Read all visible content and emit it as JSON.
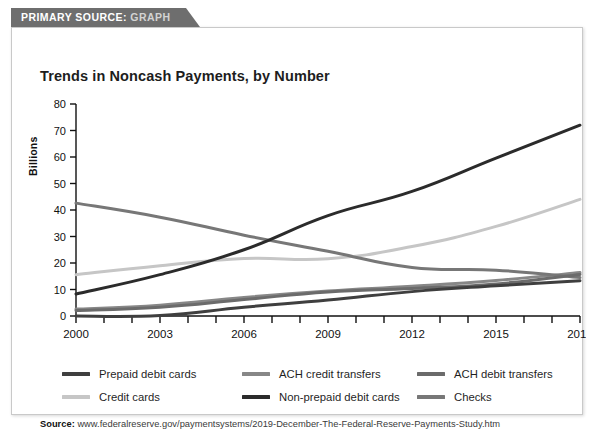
{
  "ribbon": {
    "prefix": "PRIMARY SOURCE:",
    "kind": "GRAPH"
  },
  "title": "Trends in Noncash Payments, by Number",
  "source": {
    "label": "Source:",
    "url": "www.federalreserve.gov/paymentsystems/2019-December-The-Federal-Reserve-Payments-Study.htm"
  },
  "legend": {
    "items": [
      {
        "label": "Prepaid debit cards",
        "color": "#3f3f3f"
      },
      {
        "label": "ACH credit transfers",
        "color": "#878787"
      },
      {
        "label": "ACH debit transfers",
        "color": "#6b6b6b"
      },
      {
        "label": "Credit cards",
        "color": "#c6c6c6"
      },
      {
        "label": "Non-prepaid debit cards",
        "color": "#2b2b2b"
      },
      {
        "label": "Checks",
        "color": "#777777"
      }
    ]
  },
  "chart_data": {
    "type": "line",
    "title": "Trends in Noncash Payments, by Number",
    "xlabel": "",
    "ylabel": "Billions",
    "xlim": [
      2000,
      2018
    ],
    "ylim": [
      0,
      80
    ],
    "ytick_step": 10,
    "yticks": [
      0,
      10,
      20,
      30,
      40,
      50,
      60,
      70,
      80
    ],
    "xticks": [
      2000,
      2001,
      2002,
      2003,
      2004,
      2005,
      2006,
      2007,
      2008,
      2009,
      2010,
      2011,
      2012,
      2013,
      2014,
      2015,
      2016,
      2017,
      2018
    ],
    "xtick_labels_shown": [
      2000,
      2003,
      2006,
      2009,
      2012,
      2015,
      2018
    ],
    "grid": false,
    "legend_position": "below",
    "x": [
      2000,
      2003,
      2006,
      2009,
      2012,
      2015,
      2018
    ],
    "series": [
      {
        "name": "Non-prepaid debit cards",
        "color": "#2b2b2b",
        "values": [
          8.3,
          15.6,
          25.0,
          37.9,
          47.0,
          59.6,
          72.0
        ]
      },
      {
        "name": "Credit cards",
        "color": "#c6c6c6",
        "values": [
          15.6,
          19.0,
          21.7,
          21.6,
          26.2,
          33.8,
          44.0
        ]
      },
      {
        "name": "Checks",
        "color": "#777777",
        "values": [
          42.6,
          37.3,
          30.5,
          24.4,
          18.3,
          17.3,
          14.5
        ]
      },
      {
        "name": "ACH credit transfers",
        "color": "#878787",
        "values": [
          2.6,
          4.1,
          7.0,
          9.4,
          11.2,
          13.4,
          16.4
        ]
      },
      {
        "name": "ACH debit transfers",
        "color": "#6b6b6b",
        "values": [
          2.1,
          3.3,
          6.2,
          9.1,
          10.4,
          12.1,
          15.7
        ]
      },
      {
        "name": "Prepaid debit cards",
        "color": "#3f3f3f",
        "values": [
          0.0,
          0.2,
          3.3,
          6.0,
          9.2,
          11.4,
          13.3
        ]
      }
    ]
  }
}
